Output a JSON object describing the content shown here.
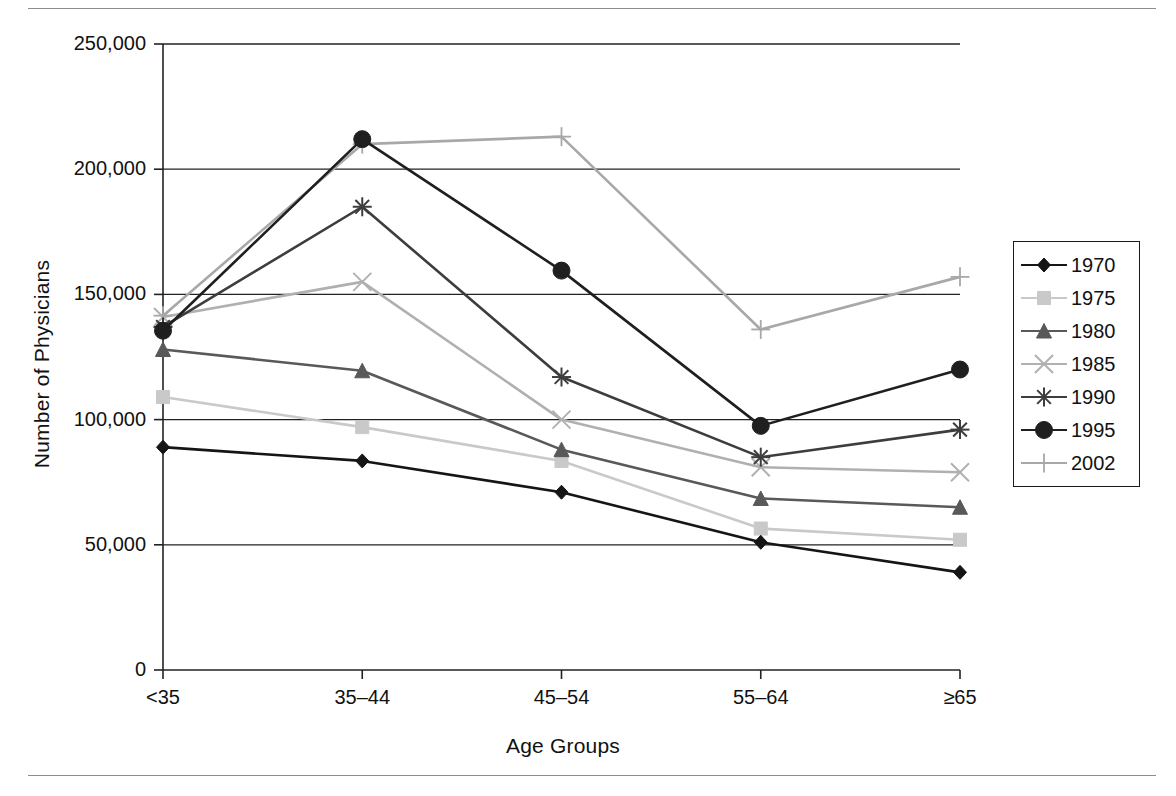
{
  "figure": {
    "has_top_rule": true,
    "has_bottom_rule": true,
    "background": "#ffffff"
  },
  "chart_data": {
    "type": "line",
    "title": "",
    "xlabel": "Age Groups",
    "ylabel": "Number of Physicians",
    "categories": [
      "<35",
      "35–44",
      "45–54",
      "55–64",
      "≥65"
    ],
    "ylim": [
      0,
      250000
    ],
    "yticks": [
      0,
      50000,
      100000,
      150000,
      200000,
      250000
    ],
    "ytick_labels": [
      "0",
      "50,000",
      "100,000",
      "150,000",
      "200,000",
      "250,000"
    ],
    "grid": "horizontal",
    "legend_position": "right-outside",
    "series": [
      {
        "name": "1970",
        "color": "#151515",
        "marker": "diamond",
        "values": [
          89000,
          83500,
          71000,
          51000,
          39000
        ]
      },
      {
        "name": "1975",
        "color": "#c9c9c9",
        "marker": "square",
        "values": [
          109000,
          97000,
          83500,
          56500,
          52000
        ]
      },
      {
        "name": "1980",
        "color": "#595959",
        "marker": "triangle",
        "values": [
          128000,
          119500,
          88000,
          68500,
          65000
        ]
      },
      {
        "name": "1985",
        "color": "#b0b0b0",
        "marker": "x",
        "values": [
          141000,
          155000,
          100000,
          81000,
          79000
        ]
      },
      {
        "name": "1990",
        "color": "#3d3d3d",
        "marker": "asterisk",
        "values": [
          137000,
          185000,
          117000,
          85000,
          96000
        ]
      },
      {
        "name": "1995",
        "color": "#1f1f1f",
        "marker": "circle",
        "values": [
          135500,
          212000,
          159500,
          97500,
          120000
        ]
      },
      {
        "name": "2002",
        "color": "#a8a8a8",
        "marker": "plus",
        "values": [
          141500,
          210000,
          213000,
          136000,
          157000
        ]
      }
    ]
  },
  "legend": {
    "items": [
      {
        "label": "1970"
      },
      {
        "label": "1975"
      },
      {
        "label": "1980"
      },
      {
        "label": "1985"
      },
      {
        "label": "1990"
      },
      {
        "label": "1995"
      },
      {
        "label": "2002"
      }
    ]
  }
}
